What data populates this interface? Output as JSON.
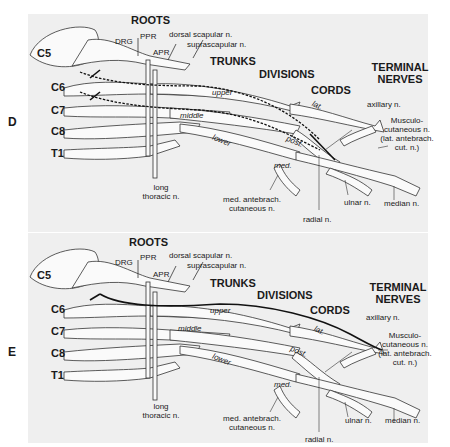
{
  "figure": {
    "panels": [
      {
        "letter": "D",
        "headers": {
          "roots": "ROOTS",
          "trunks": "TRUNKS",
          "divisions": "DIVISIONS",
          "cords": "CORDS",
          "terminal_1": "TERMINAL",
          "terminal_2": "NERVES"
        },
        "roots": [
          "C5",
          "C6",
          "C7",
          "C8",
          "T1"
        ],
        "root_parts": {
          "drg": "DRG",
          "ppr": "PPR",
          "apr": "APR"
        },
        "branches": {
          "dorsal_scapular": "dorsal scapular n.",
          "suprascapular": "suprascapular n.",
          "long_thoracic_1": "long",
          "long_thoracic_2": "thoracic n."
        },
        "trunk_labels": {
          "upper": "upper",
          "middle": "middle",
          "lower": "lower"
        },
        "cord_labels": {
          "lat": "lat.",
          "post": "post.",
          "med": "med."
        },
        "terminal": {
          "axillary": "axillary n.",
          "musculo_1": "Musculo-",
          "musculo_2": "cutaneous n.",
          "musculo_3": "(lat. antebrach.",
          "musculo_4": "cut. n.)",
          "med_antebrach_1": "med. antebrach.",
          "med_antebrach_2": "cutaneous n.",
          "ulnar": "ulnar n.",
          "median": "median n.",
          "radial": "radial n."
        },
        "highlight": "dashed pathway C5/C6 through upper trunk and posterior cord to radial n."
      },
      {
        "letter": "E",
        "headers": {
          "roots": "ROOTS",
          "trunks": "TRUNKS",
          "divisions": "DIVISIONS",
          "cords": "CORDS",
          "terminal_1": "TERMINAL",
          "terminal_2": "NERVES"
        },
        "roots": [
          "C5",
          "C6",
          "C7",
          "C8",
          "T1"
        ],
        "root_parts": {
          "drg": "DRG",
          "ppr": "PPR",
          "apr": "APR"
        },
        "branches": {
          "dorsal_scapular": "dorsal scapular n.",
          "suprascapular": "suprascapular n.",
          "long_thoracic_1": "long",
          "long_thoracic_2": "thoracic n."
        },
        "trunk_labels": {
          "upper": "upper",
          "middle": "middle",
          "lower": "lower"
        },
        "cord_labels": {
          "lat": "lat.",
          "post": "post.",
          "med": "med."
        },
        "terminal": {
          "axillary": "axillary n.",
          "musculo_1": "Musculo-",
          "musculo_2": "cutaneous n.",
          "musculo_3": "(lat. antebrach.",
          "musculo_4": "cut. n.)",
          "med_antebrach_1": "med. antebrach.",
          "med_antebrach_2": "cutaneous n.",
          "ulnar": "ulnar n.",
          "median": "median n.",
          "radial": "radial n."
        },
        "highlight": "solid pathway C6 through upper trunk and lateral cord to musculocutaneous n."
      }
    ]
  }
}
